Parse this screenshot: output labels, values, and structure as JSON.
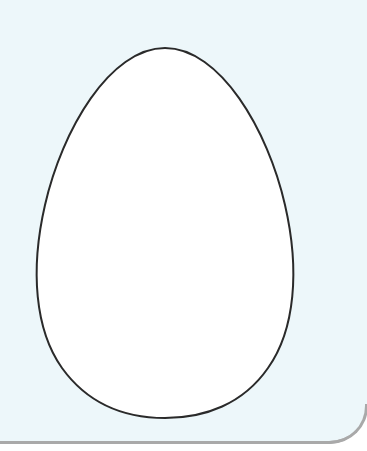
{
  "figure": {
    "colors": {
      "background": "#edf7fa",
      "egg_fill": "#ffffff",
      "egg_stroke": "#2a2a2a",
      "border": "#a9a9a9"
    }
  }
}
